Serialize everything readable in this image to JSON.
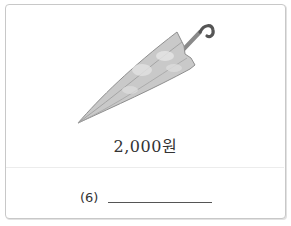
{
  "item": {
    "name": "umbrella",
    "price_label": "2,000원"
  },
  "question": {
    "number_label": "(6)",
    "answer_value": ""
  }
}
